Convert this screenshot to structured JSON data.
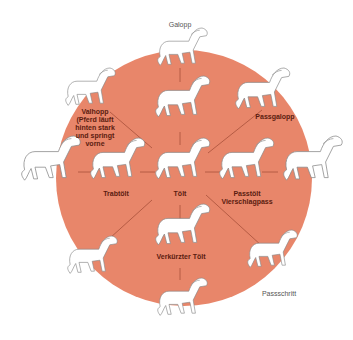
{
  "diagram": {
    "circle_color": "#E8866A",
    "line_color": "#A8503A",
    "center": {
      "label": "Tölt"
    },
    "inner_ring": [
      {
        "id": "galopp-inner",
        "label": ""
      },
      {
        "id": "passgalopp",
        "label": "Passgalopp"
      },
      {
        "id": "passtoelt",
        "label": "Passtölt\nViersch­lagpass"
      },
      {
        "id": "verkuerzter-toelt",
        "label": "Verkürzter Tölt"
      },
      {
        "id": "trabtoelt",
        "label": "Trabtölt"
      },
      {
        "id": "valhopp",
        "label": "Valhopp\n(Pferd läuft\nhinten stark\nund springt\nvorne"
      }
    ],
    "outer_labels": {
      "galopp": "Galopp",
      "passschritt": "Passschritt"
    }
  }
}
